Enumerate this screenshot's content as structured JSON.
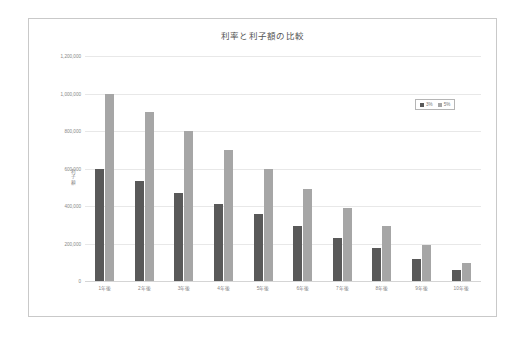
{
  "chart_data": {
    "type": "bar",
    "title": "利率と利子額の比較",
    "xlabel": "",
    "ylabel": "利子額",
    "ylim": [
      0,
      1200000
    ],
    "ytick_labels": [
      "1,200,000",
      "1,000,000",
      "800,000",
      "600,000",
      "400,000",
      "200,000",
      "0"
    ],
    "ytick_values": [
      1200000,
      1000000,
      800000,
      600000,
      400000,
      200000,
      0
    ],
    "grid": true,
    "legend_position": "upper-right",
    "categories": [
      "1年後",
      "2年後",
      "3年後",
      "4年後",
      "5年後",
      "6年後",
      "7年後",
      "8年後",
      "9年後",
      "10年後"
    ],
    "series": [
      {
        "name": "3%",
        "color": "#595959",
        "values": [
          600000,
          535000,
          470000,
          412000,
          355000,
          292000,
          232000,
          175000,
          115000,
          58000
        ]
      },
      {
        "name": "5%",
        "color": "#a6a6a6",
        "values": [
          1000000,
          900000,
          800000,
          700000,
          595000,
          490000,
          388000,
          292000,
          192000,
          95000
        ]
      }
    ]
  },
  "legend": {
    "entries": [
      {
        "label": "3%"
      },
      {
        "label": "5%"
      }
    ]
  }
}
